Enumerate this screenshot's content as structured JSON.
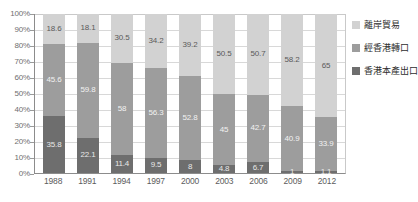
{
  "chart_data": {
    "type": "bar",
    "subtype": "stacked-percentage",
    "title": "",
    "xlabel": "",
    "ylabel": "",
    "ylim": [
      0,
      100
    ],
    "ytick_labels": [
      "0%",
      "10%",
      "20%",
      "30%",
      "40%",
      "50%",
      "60%",
      "70%",
      "80%",
      "90%",
      "100%"
    ],
    "ytick_values": [
      0,
      10,
      20,
      30,
      40,
      50,
      60,
      70,
      80,
      90,
      100
    ],
    "grid": true,
    "legend_position": "right",
    "categories": [
      "1988",
      "1991",
      "1994",
      "1997",
      "2000",
      "2003",
      "2006",
      "2009",
      "2012"
    ],
    "series": [
      {
        "name": "離岸貿易",
        "key": "offshore",
        "color": "#d2d2d2",
        "values": [
          18.6,
          18.1,
          30.5,
          34.2,
          39.2,
          50.5,
          50.7,
          58.2,
          65
        ],
        "labels": [
          "18.6",
          "18.1",
          "30.5",
          "34.2",
          "39.2",
          "50.5",
          "50.7",
          "58.2",
          "65"
        ]
      },
      {
        "name": "經香港轉口",
        "key": "reexport",
        "color": "#9d9d9d",
        "values": [
          45.6,
          59.8,
          58,
          56.3,
          52.8,
          45,
          42.7,
          40.9,
          33.9
        ],
        "labels": [
          "45.6",
          "59.8",
          "58",
          "56.3",
          "52.8",
          "45",
          "42.7",
          "40.9",
          "33.9"
        ]
      },
      {
        "name": "香港本產出口",
        "key": "domestic",
        "color": "#6e6e6e",
        "values": [
          35.8,
          22.1,
          11.4,
          9.5,
          8,
          4.8,
          6.7,
          1,
          1.1
        ],
        "labels": [
          "35.8",
          "22.1",
          "11.4",
          "9.5",
          "8",
          "4.8",
          "6.7",
          "1",
          "1.1"
        ]
      }
    ]
  },
  "legend": {
    "items": [
      {
        "label": "離岸貿易",
        "color": "#d2d2d2"
      },
      {
        "label": "經香港轉口",
        "color": "#9d9d9d"
      },
      {
        "label": "香港本產出口",
        "color": "#6e6e6e"
      }
    ]
  },
  "colors": {
    "offshore": "#d2d2d2",
    "reexport": "#9d9d9d",
    "domestic": "#6e6e6e",
    "axis": "#8c8c8c",
    "grid": "#d8d8d8",
    "background": "#ffffff"
  }
}
